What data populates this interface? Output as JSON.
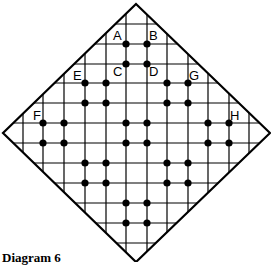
{
  "diagram": {
    "caption": "Diagram 6",
    "colors": {
      "line": "#000000",
      "dot": "#000000",
      "background": "#ffffff"
    },
    "diamond": {
      "top": [
        136,
        4
      ],
      "right": [
        270,
        133
      ],
      "bottom": [
        136,
        262
      ],
      "left": [
        3,
        133
      ]
    },
    "grid": {
      "vertical_x": [
        23,
        43,
        64,
        85,
        106,
        126,
        147,
        167,
        188,
        208,
        229,
        249
      ],
      "horizontal_y": [
        24,
        44,
        64,
        83,
        103,
        123,
        143,
        163,
        183,
        203,
        223,
        243
      ]
    },
    "dots": [
      [
        126,
        44
      ],
      [
        147,
        44
      ],
      [
        126,
        64
      ],
      [
        147,
        64
      ],
      [
        85,
        83
      ],
      [
        106,
        83
      ],
      [
        85,
        103
      ],
      [
        106,
        103
      ],
      [
        167,
        83
      ],
      [
        188,
        83
      ],
      [
        167,
        103
      ],
      [
        188,
        103
      ],
      [
        43,
        123
      ],
      [
        64,
        123
      ],
      [
        43,
        143
      ],
      [
        64,
        143
      ],
      [
        126,
        123
      ],
      [
        147,
        123
      ],
      [
        126,
        143
      ],
      [
        147,
        143
      ],
      [
        208,
        123
      ],
      [
        229,
        123
      ],
      [
        208,
        143
      ],
      [
        229,
        143
      ],
      [
        85,
        163
      ],
      [
        106,
        163
      ],
      [
        85,
        183
      ],
      [
        106,
        183
      ],
      [
        167,
        163
      ],
      [
        188,
        163
      ],
      [
        167,
        183
      ],
      [
        188,
        183
      ],
      [
        126,
        203
      ],
      [
        147,
        203
      ],
      [
        126,
        223
      ],
      [
        147,
        223
      ]
    ],
    "labels": [
      {
        "text": "A",
        "x": 113,
        "y": 40
      },
      {
        "text": "B",
        "x": 149,
        "y": 40
      },
      {
        "text": "C",
        "x": 113,
        "y": 76
      },
      {
        "text": "D",
        "x": 149,
        "y": 76
      },
      {
        "text": "E",
        "x": 73,
        "y": 80
      },
      {
        "text": "G",
        "x": 189,
        "y": 80
      },
      {
        "text": "F",
        "x": 33,
        "y": 120
      },
      {
        "text": "H",
        "x": 230,
        "y": 120
      }
    ]
  }
}
